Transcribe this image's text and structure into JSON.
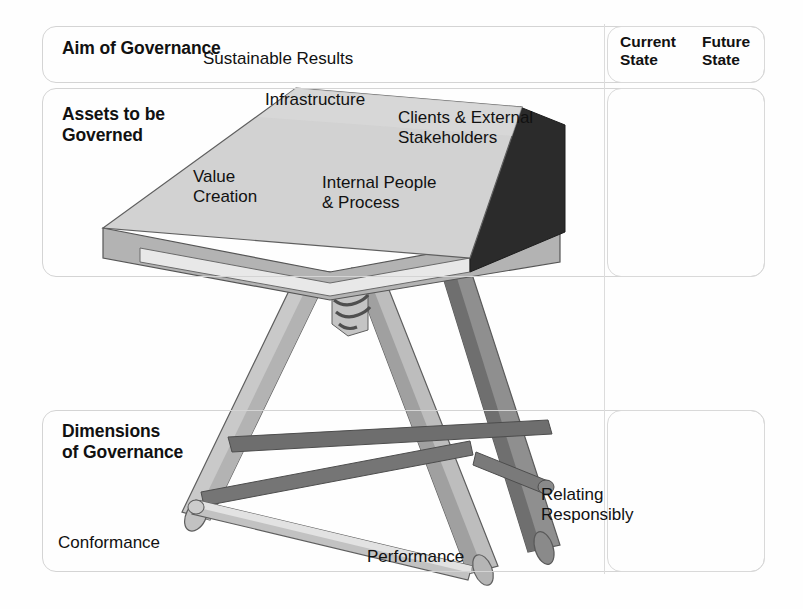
{
  "diagram": {
    "rows": [
      {
        "key": "aim",
        "label": "Aim of Governance",
        "content": "Sustainable Results"
      },
      {
        "key": "assets",
        "label": "Assets to be\nGoverned",
        "content": ""
      },
      {
        "key": "dims",
        "label": "Dimensions\nof Governance",
        "content": ""
      }
    ],
    "state_columns": [
      {
        "label": "Current\nState"
      },
      {
        "label": "Future\nState"
      }
    ],
    "assets": [
      {
        "name": "Infrastructure"
      },
      {
        "name": "Clients & External\nStakeholders"
      },
      {
        "name": "Value\nCreation"
      },
      {
        "name": "Internal People\n& Process"
      }
    ],
    "dimensions": [
      {
        "name": "Conformance"
      },
      {
        "name": "Performance"
      },
      {
        "name": "Relating\nResponsibly"
      }
    ],
    "colors": {
      "tabletop": "#d2d2d2",
      "tabletop_front_edge": "#b0b0b0",
      "tabletop_right_edge": "#2b2b2b",
      "leg_light": "#c9c9c9",
      "leg_mid": "#a8a8a8",
      "leg_dark": "#808080",
      "crossbar_dark": "#6e6e6e",
      "outline": "#555555",
      "frame_border": "#d4d4d4",
      "text": "#111111",
      "background": "#fefefe"
    }
  }
}
